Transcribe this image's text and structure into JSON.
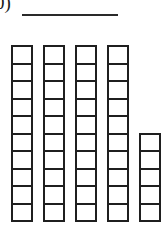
{
  "figure": {
    "label": "0)",
    "type": "base-ten-block-columns",
    "background_color": "#ffffff",
    "ink_color": "#1f1f1f"
  },
  "top_rule": {
    "name": "horizontal-rule",
    "color": "#2a2a2a",
    "x": 22,
    "y": 14,
    "width": 96,
    "height": 2
  },
  "chart_data": {
    "type": "bar",
    "title": "",
    "subtitle": "",
    "xlabel": "",
    "ylabel": "",
    "categories": [
      "1",
      "2",
      "3",
      "4",
      "5"
    ],
    "values": [
      10,
      10,
      10,
      10,
      5
    ],
    "ylim": [
      0,
      10
    ],
    "grid": false,
    "legend": null,
    "unit": "square",
    "total": 45
  },
  "columns": [
    {
      "name": "column-1",
      "cells": 10,
      "x": 11,
      "cell_width": 22,
      "cell_height": 19.5
    },
    {
      "name": "column-2",
      "cells": 10,
      "x": 43,
      "cell_width": 22,
      "cell_height": 19.5
    },
    {
      "name": "column-3",
      "cells": 10,
      "x": 75,
      "cell_width": 22,
      "cell_height": 19.5
    },
    {
      "name": "column-4",
      "cells": 10,
      "x": 107,
      "cell_width": 22,
      "cell_height": 19.5
    },
    {
      "name": "column-5",
      "cells": 5,
      "x": 139,
      "cell_width": 22,
      "cell_height": 19.5
    }
  ]
}
